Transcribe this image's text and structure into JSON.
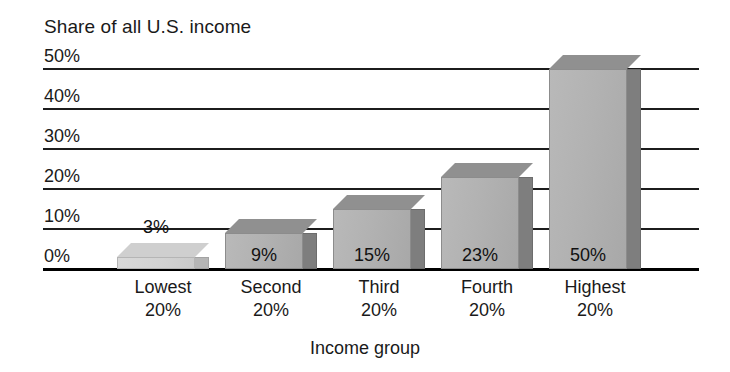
{
  "chart_data": {
    "type": "bar",
    "title": "",
    "ylabel": "Share of all U.S. income",
    "xlabel": "Income group",
    "categories": [
      "Lowest 20%",
      "Second 20%",
      "Third 20%",
      "Fourth 20%",
      "Highest 20%"
    ],
    "category_lines": [
      [
        "Lowest",
        "20%"
      ],
      [
        "Second",
        "20%"
      ],
      [
        "Third",
        "20%"
      ],
      [
        "Fourth",
        "20%"
      ],
      [
        "Highest",
        "20%"
      ]
    ],
    "values": [
      3,
      9,
      15,
      23,
      50
    ],
    "value_labels": [
      "3%",
      "9%",
      "15%",
      "23%",
      "50%"
    ],
    "ylim": [
      0,
      50
    ],
    "ytick_values": [
      0,
      10,
      20,
      30,
      40,
      50
    ],
    "ytick_labels": [
      "0%",
      "10%",
      "20%",
      "30%",
      "40%",
      "50%"
    ],
    "grid": true,
    "legend": "none",
    "bar_style": "3d-extruded",
    "colors": {
      "bar_front": "#b2b2b2",
      "bar_front_light": "#d2d2d2",
      "bar_side": "#7e7e7e",
      "bar_top": "#909090",
      "gridline": "#1c1c1c",
      "axis": "#000000",
      "text": "#1a1a1a",
      "background": "#ffffff"
    }
  }
}
